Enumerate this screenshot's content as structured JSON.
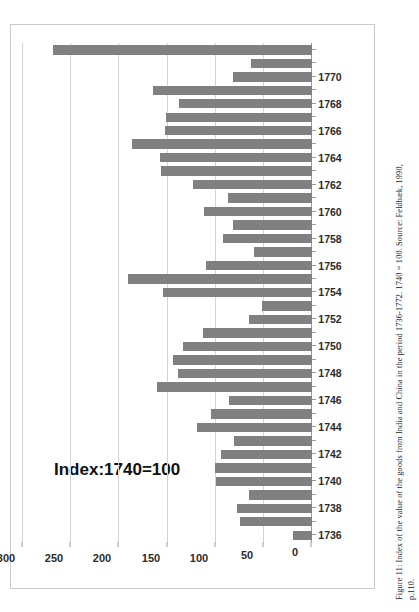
{
  "figure": {
    "caption_line1": "Figure 11: Index of the value of the goods from India and China in the period 1736-1772. 1740 = 100. Source: Feldbæk, 1990,",
    "caption_line2": "p.110."
  },
  "chart_data": {
    "type": "bar",
    "orientation": "horizontal-rotated",
    "title": "Index:1740=100",
    "xlabel": "",
    "ylabel": "",
    "ylim": [
      0,
      300
    ],
    "yticks": [
      300,
      250,
      200,
      150,
      100,
      50,
      0
    ],
    "grid": true,
    "legend": null,
    "bar_color": "#808080",
    "categories": [
      "1736",
      "1737",
      "1738",
      "1739",
      "1740",
      "1741",
      "1742",
      "1743",
      "1744",
      "1745",
      "1746",
      "1747",
      "1748",
      "1749",
      "1750",
      "1751",
      "1752",
      "1753",
      "1754",
      "1755",
      "1756",
      "1757",
      "1758",
      "1759",
      "1760",
      "1761",
      "1762",
      "1763",
      "1764",
      "1765",
      "1766",
      "1767",
      "1768",
      "1769",
      "1770",
      "1771",
      "1772"
    ],
    "tick_labels": [
      "1736",
      "",
      "1738",
      "",
      "1740",
      "",
      "1742",
      "",
      "1744",
      "",
      "1746",
      "",
      "1748",
      "",
      "1750",
      "",
      "1752",
      "",
      "1754",
      "",
      "1756",
      "",
      "1758",
      "",
      "1760",
      "",
      "1762",
      "",
      "1764",
      "",
      "1766",
      "",
      "1768",
      "",
      "1770",
      "",
      ""
    ],
    "values": [
      20,
      75,
      78,
      65,
      100,
      101,
      94,
      81,
      119,
      105,
      86,
      161,
      139,
      144,
      134,
      113,
      65,
      52,
      155,
      191,
      110,
      60,
      92,
      82,
      112,
      87,
      124,
      157,
      158,
      187,
      153,
      152,
      138,
      165,
      82,
      63,
      269
    ]
  }
}
